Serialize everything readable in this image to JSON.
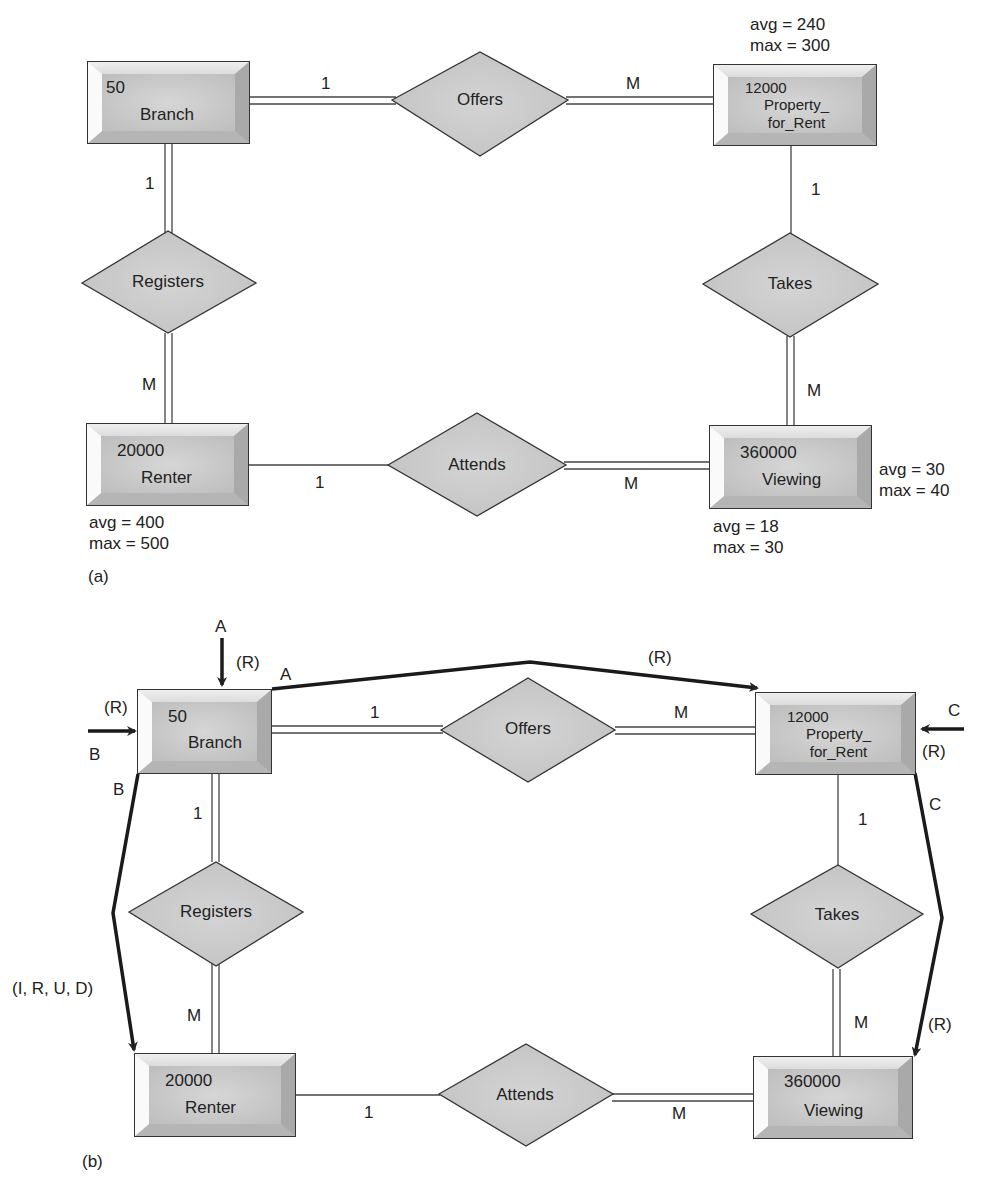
{
  "figure_a": {
    "label": "(a)",
    "entities": {
      "branch": {
        "count": "50",
        "name": "Branch"
      },
      "property": {
        "count": "12000",
        "name": "Property_\nfor_Rent",
        "note": "avg = 240\nmax = 300"
      },
      "renter": {
        "count": "20000",
        "name": "Renter",
        "note": "avg = 400\nmax = 500"
      },
      "viewing": {
        "count": "360000",
        "name": "Viewing",
        "note_right": "avg = 30\nmax = 40",
        "note_below": "avg = 18\nmax = 30"
      }
    },
    "relationships": {
      "offers": "Offers",
      "registers": "Registers",
      "takes": "Takes",
      "attends": "Attends"
    },
    "cardinalities": {
      "offers_branch": "1",
      "offers_property": "M",
      "registers_branch": "1",
      "registers_renter": "M",
      "takes_property": "1",
      "takes_viewing": "M",
      "attends_renter": "1",
      "attends_viewing": "M"
    }
  },
  "figure_b": {
    "label": "(b)",
    "entities": {
      "branch": {
        "count": "50",
        "name": "Branch"
      },
      "property": {
        "count": "12000",
        "name": "Property_\nfor_Rent"
      },
      "renter": {
        "count": "20000",
        "name": "Renter"
      },
      "viewing": {
        "count": "360000",
        "name": "Viewing"
      }
    },
    "relationships": {
      "offers": "Offers",
      "registers": "Registers",
      "takes": "Takes",
      "attends": "Attends"
    },
    "cardinalities": {
      "offers_branch": "1",
      "offers_property": "M",
      "registers_branch": "1",
      "registers_renter": "M",
      "takes_property": "1",
      "takes_viewing": "M",
      "attends_renter": "1",
      "attends_viewing": "M"
    },
    "transactions": {
      "a_top": "A",
      "a_top_op": "(R)",
      "a_corner": "A",
      "a_path_op": "(R)",
      "b_left_op": "(R)",
      "b_left": "B",
      "b_corner": "B",
      "b_path_op": "(I, R, U, D)",
      "c_right": "C",
      "c_right_op": "(R)",
      "c_corner": "C",
      "c_path_op": "(R)"
    }
  }
}
